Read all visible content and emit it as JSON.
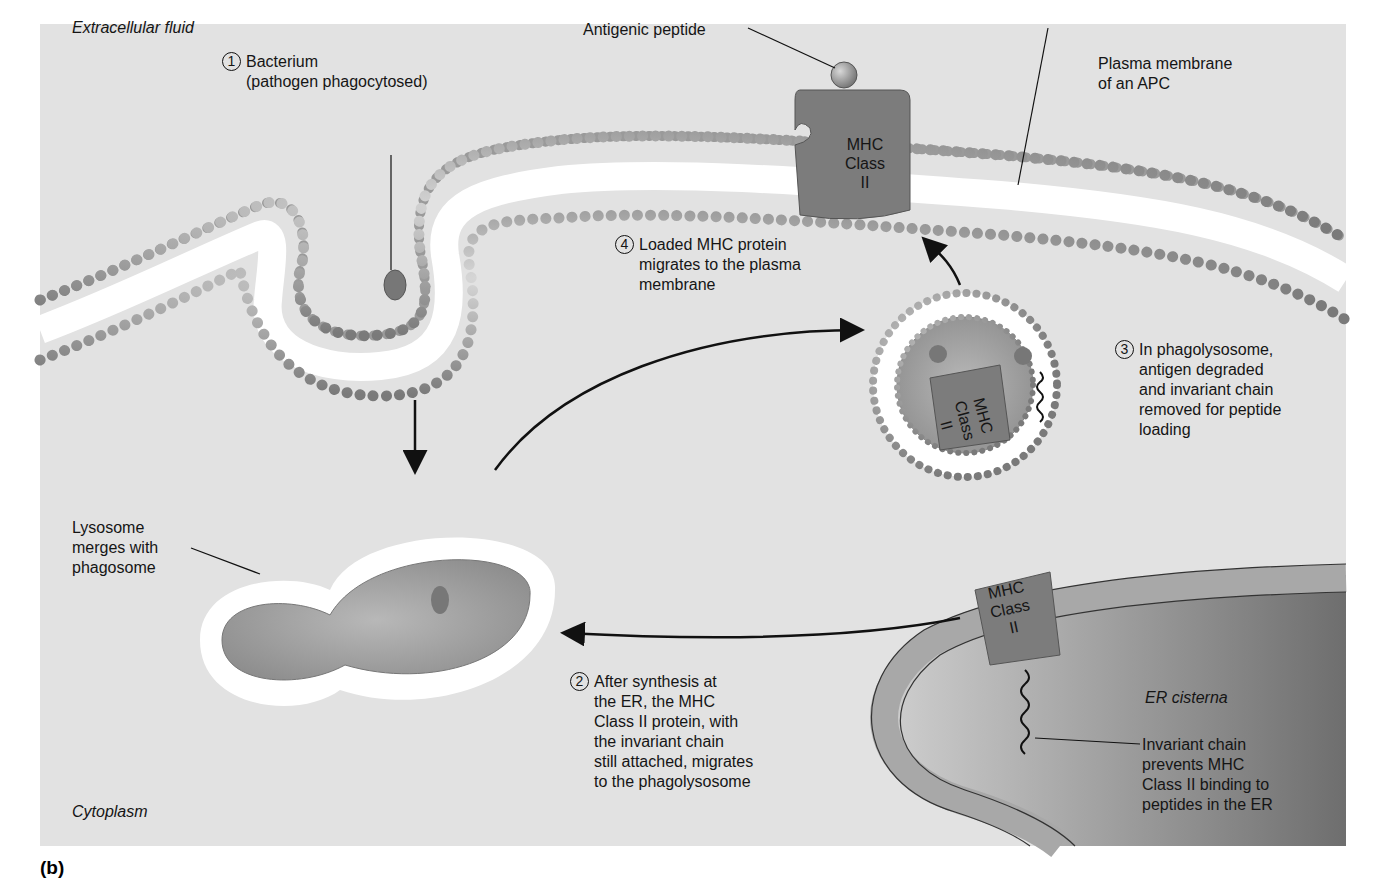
{
  "figure": {
    "panel_label": "(b)",
    "background_color": "#e2e2e2",
    "membrane_head_color": "#9a9a9a",
    "mhc_protein_color": "#7c7c7c"
  },
  "regions": {
    "extracellular": "Extracellular fluid",
    "cytoplasm": "Cytoplasm",
    "er": "ER cisterna"
  },
  "labels": {
    "antigenic_peptide": "Antigenic peptide",
    "plasma_membrane": "Plasma membrane\nof an APC",
    "lysosome": "Lysosome\nmerges with\nphagosome",
    "invariant_chain": "Invariant chain\nprevents MHC\nClass II binding to\npeptides in the ER",
    "mhc_top": "MHC\nClass\nII",
    "mhc_phago": "MHC\nClass\nII",
    "mhc_er": "MHC\nClass\nII"
  },
  "steps": [
    {
      "number": "1",
      "text": "Bacterium\n(pathogen phagocytosed)"
    },
    {
      "number": "2",
      "text": "After synthesis at\nthe ER, the MHC\nClass II protein, with\nthe invariant chain\nstill attached, migrates\nto the phagolysosome"
    },
    {
      "number": "3",
      "text": "In phagolysosome,\nantigen degraded\nand invariant chain\nremoved for peptide\nloading"
    },
    {
      "number": "4",
      "text": "Loaded MHC protein\nmigrates to the plasma\nmembrane"
    }
  ]
}
